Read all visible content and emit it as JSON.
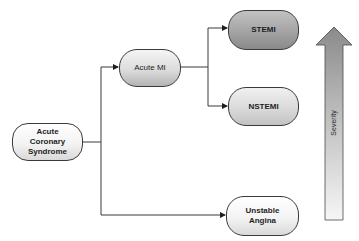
{
  "diagram": {
    "nodes": {
      "acs": {
        "label": "Acute Coronary Syndrome",
        "lines": [
          "Acute",
          "Coronary",
          "Syndrome"
        ]
      },
      "acute_mi": {
        "label": "Acute MI"
      },
      "stemi": {
        "label": "STEMI"
      },
      "nstemi": {
        "label": "NSTEMI"
      },
      "unstable_angina": {
        "label": "Unstable Angina",
        "lines": [
          "Unstable",
          "Angina"
        ]
      }
    },
    "edges": [
      {
        "from": "Acute Coronary Syndrome",
        "to": "Acute MI"
      },
      {
        "from": "Acute Coronary Syndrome",
        "to": "Unstable Angina"
      },
      {
        "from": "Acute MI",
        "to": "STEMI"
      },
      {
        "from": "Acute MI",
        "to": "NSTEMI"
      }
    ],
    "severity_arrow": {
      "label": "Severity",
      "direction": "up"
    }
  },
  "colors": {
    "line": "#3a3a3a",
    "stemi_fill": "#a6a6a6",
    "arrow_top": "#8c8c8c",
    "arrow_bottom": "#f4f4f4"
  }
}
